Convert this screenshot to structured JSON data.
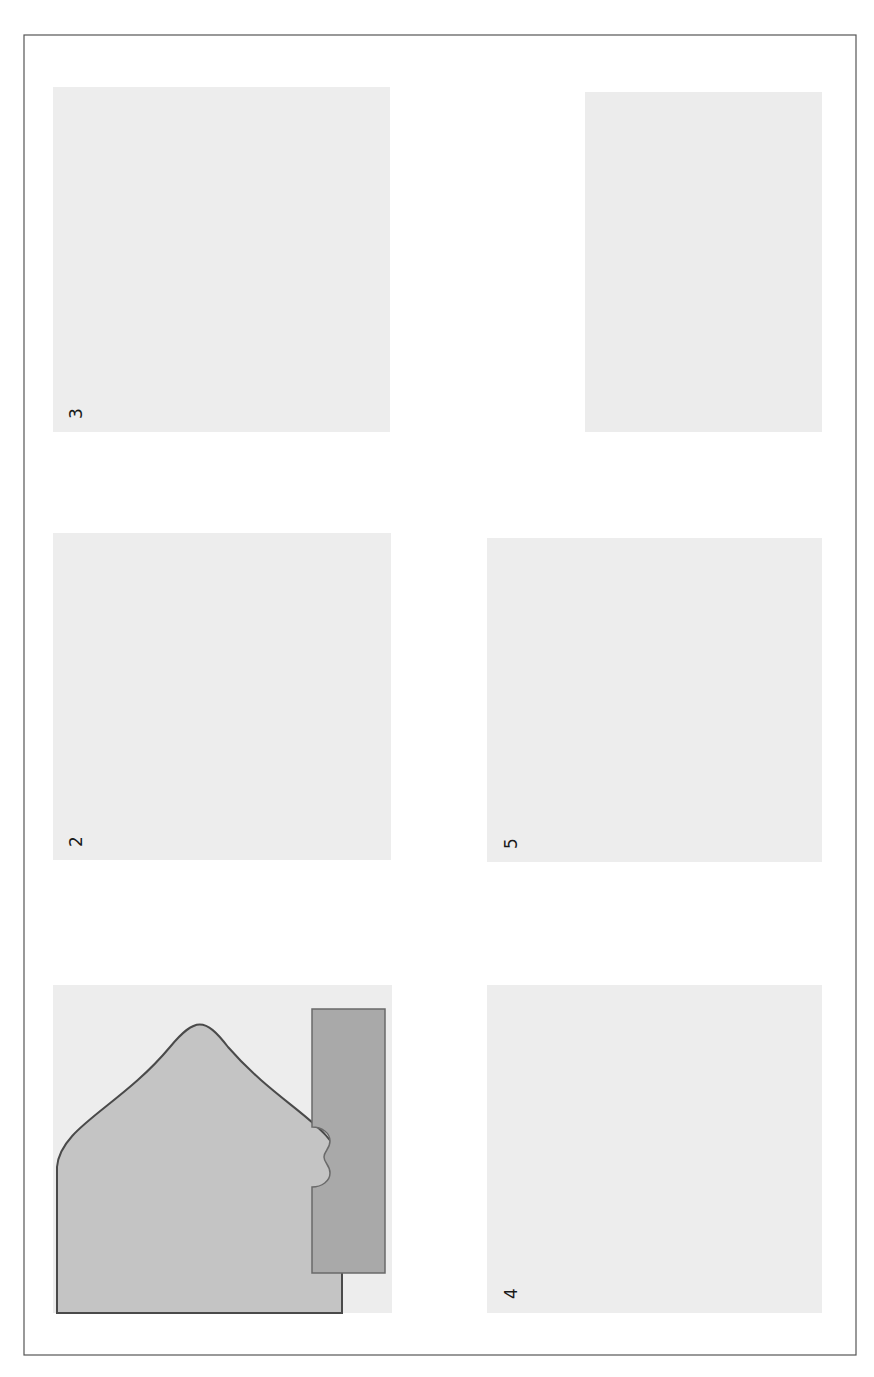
{
  "figure": {
    "orientation": "rotated-90-ccw",
    "panels": [
      {
        "id": 1,
        "number": "1",
        "labels": {
          "ach": "AcH",
          "calcium_outside": "Ca++",
          "calcium_inside_1": "Ca++",
          "calcium_inside_2": "Ca++",
          "snap25": "SNAP-25",
          "syntaxin": "S",
          "vamp": "V",
          "plus_charges": [
            "+",
            "+",
            "+",
            "+"
          ],
          "minus_charges": [
            "−",
            "−",
            "−",
            "−"
          ]
        },
        "callout": "Nicotinic receptor on muscle"
      },
      {
        "id": 2,
        "number": "2",
        "labels": {
          "ach": "AcH",
          "calcium_eq": "Ca++ + Ca++",
          "snap25": "SNAP-25",
          "syntaxin": "S",
          "vamp": "V"
        }
      },
      {
        "id": 3,
        "number": "3",
        "labels": {
          "ach": "AcH",
          "snap25": "SNAP-25",
          "syntaxin": "S",
          "vamp": "V"
        }
      },
      {
        "id": 4,
        "number": "4",
        "labels": {
          "ach": "AcH"
        }
      },
      {
        "id": 5,
        "number": "5",
        "labels": {
          "ach": "AcH",
          "choline": "Choline",
          "acetate": "Acetate",
          "contraction": "Contraction",
          "muscle": "Muscle"
        }
      }
    ],
    "legend": {
      "items": [
        {
          "symbol": "AcH",
          "label": "Acetylcholine"
        },
        {
          "symbol": "Ca++",
          "label": "Calcium"
        }
      ],
      "protein_complex": {
        "title": "Protein Complex",
        "items": [
          {
            "symbol": "SNAP-25",
            "label_line1": "Synaptosomal",
            "label_line2": "associated protein"
          },
          {
            "symbol": "S",
            "label_line1": "Syntaxin"
          },
          {
            "symbol": "V",
            "label_line1": "VAMP",
            "label_line2": "Vesicle Associated",
            "label_line3": "Membrane Protein",
            "label_line4": "(Synaptobrevin)"
          }
        ]
      }
    },
    "colors": {
      "panel_background": "#ededed",
      "nerve_terminal": "#c4c4c4",
      "muscle": "#a9a9a9",
      "outline": "#4a4a4a"
    }
  }
}
